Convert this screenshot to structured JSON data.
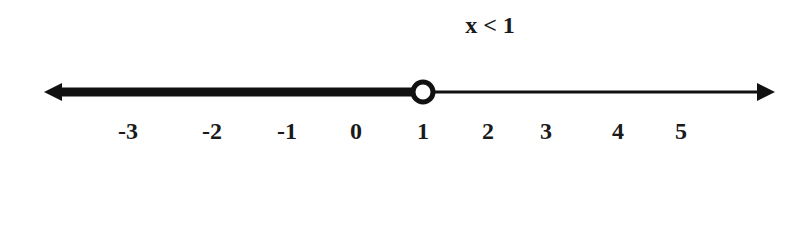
{
  "title": "x < 1",
  "number_line": {
    "labels": [
      "-3",
      "-2",
      "-1",
      "0",
      "1",
      "2",
      "3",
      "4",
      "5"
    ],
    "label_positions": [
      128,
      212,
      287,
      356,
      423,
      488,
      546,
      618,
      681
    ],
    "boundary_value": "1",
    "boundary_point": "open-circle",
    "shaded_direction": "left",
    "line_color": "#111111"
  }
}
